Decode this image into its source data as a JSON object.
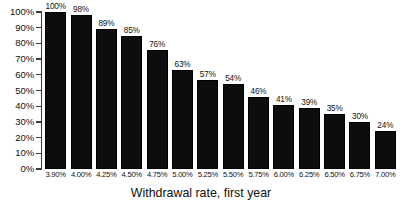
{
  "chart_data": {
    "type": "bar",
    "title": "",
    "subtitle": "",
    "xlabel": "Withdrawal rate, first year",
    "ylabel": "",
    "categories": [
      "3.90%",
      "4.00%",
      "4.25%",
      "4.50%",
      "4.75%",
      "5.00%",
      "5.25%",
      "5.50%",
      "5.75%",
      "6.00%",
      "6.25%",
      "6.50%",
      "6.75%",
      "7.00%"
    ],
    "values": [
      100,
      98,
      89,
      85,
      76,
      63,
      57,
      54,
      46,
      41,
      39,
      35,
      30,
      24
    ],
    "value_labels": [
      "100%",
      "98%",
      "89%",
      "85%",
      "76%",
      "63%",
      "57%",
      "54%",
      "46%",
      "41%",
      "39%",
      "35%",
      "30%",
      "24%"
    ],
    "ylim": [
      0,
      100
    ],
    "y_ticks": [
      100,
      90,
      80,
      70,
      60,
      50,
      40,
      30,
      20,
      10,
      0
    ],
    "y_tick_labels": [
      "100%",
      "90%",
      "80%",
      "70%",
      "60%",
      "50%",
      "40%",
      "30%",
      "20%",
      "10%",
      "0%"
    ],
    "grid": false,
    "legend": null,
    "legend_position": "none",
    "bar_color": "#0d0d0d",
    "axis_color": "#3b3b3b",
    "background_color": "#ffffff",
    "data_labels_shown": true
  }
}
